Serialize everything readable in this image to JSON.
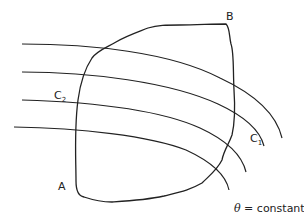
{
  "diagram": {
    "title": "",
    "labels": {
      "corner_a": "A",
      "corner_b": "B",
      "curve_c1": "C",
      "curve_c1_sub": "1",
      "curve_c2": "C",
      "curve_c2_sub": "2",
      "theta_symbol": "θ",
      "theta_text": " = constant"
    },
    "elements": [
      {
        "type": "closed-region",
        "description": "irregular region bounded by path from A to B"
      },
      {
        "type": "curve-family",
        "count": 4,
        "description": "family of curves θ = constant crossing the region"
      }
    ],
    "stroke_color": "#222222"
  }
}
